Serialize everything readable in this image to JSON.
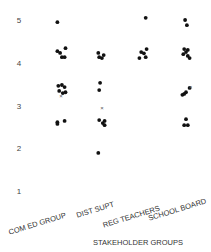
{
  "chart_data": {
    "type": "scatter",
    "title": "",
    "xlabel": "STAKEHOLDER GROUPS",
    "ylabel": "",
    "ylim": [
      1,
      5
    ],
    "yticks": [
      1,
      2,
      3,
      4,
      5
    ],
    "grid": false,
    "legend": "none",
    "categories": [
      "COM ED GROUP",
      "DIST SUPT",
      "REG TEACHERS",
      "SCHOOL BOARD"
    ],
    "series": [
      {
        "name": "COM ED GROUP",
        "points": [
          {
            "jitter": -0.2,
            "y": 4.95,
            "marker": "dot"
          },
          {
            "jitter": -0.2,
            "y": 4.27,
            "marker": "dot"
          },
          {
            "jitter": -0.05,
            "y": 4.23,
            "marker": "dot"
          },
          {
            "jitter": 0.25,
            "y": 4.34,
            "marker": "dot"
          },
          {
            "jitter": 0.05,
            "y": 4.13,
            "marker": "dot"
          },
          {
            "jitter": 0.2,
            "y": 4.13,
            "marker": "dot"
          },
          {
            "jitter": -0.15,
            "y": 3.46,
            "marker": "dot"
          },
          {
            "jitter": 0.05,
            "y": 3.48,
            "marker": "dot"
          },
          {
            "jitter": 0.2,
            "y": 3.43,
            "marker": "dot"
          },
          {
            "jitter": -0.1,
            "y": 3.34,
            "marker": "dot"
          },
          {
            "jitter": 0.1,
            "y": 3.29,
            "marker": "dot"
          },
          {
            "jitter": 0.25,
            "y": 3.31,
            "marker": "dot"
          },
          {
            "jitter": 0.0,
            "y": 3.22,
            "marker": "x"
          },
          {
            "jitter": -0.2,
            "y": 2.61,
            "marker": "dot"
          },
          {
            "jitter": -0.2,
            "y": 2.57,
            "marker": "dot"
          },
          {
            "jitter": 0.2,
            "y": 2.64,
            "marker": "dot"
          }
        ]
      },
      {
        "name": "DIST SUPT",
        "points": [
          {
            "jitter": -0.15,
            "y": 4.23,
            "marker": "dot"
          },
          {
            "jitter": -0.1,
            "y": 4.13,
            "marker": "dot"
          },
          {
            "jitter": 0.15,
            "y": 4.18,
            "marker": "dot"
          },
          {
            "jitter": 0.05,
            "y": 4.11,
            "marker": "dot"
          },
          {
            "jitter": -0.05,
            "y": 3.53,
            "marker": "dot"
          },
          {
            "jitter": -0.1,
            "y": 3.36,
            "marker": "dot"
          },
          {
            "jitter": 0.05,
            "y": 2.94,
            "marker": "x"
          },
          {
            "jitter": -0.1,
            "y": 2.66,
            "marker": "dot"
          },
          {
            "jitter": 0.1,
            "y": 2.59,
            "marker": "dot"
          },
          {
            "jitter": 0.2,
            "y": 2.64,
            "marker": "dot"
          },
          {
            "jitter": 0.2,
            "y": 2.54,
            "marker": "dot"
          },
          {
            "jitter": -0.15,
            "y": 1.89,
            "marker": "dot"
          }
        ]
      },
      {
        "name": "REG TEACHERS",
        "points": [
          {
            "jitter": 0.15,
            "y": 5.05,
            "marker": "dot"
          },
          {
            "jitter": -0.1,
            "y": 4.25,
            "marker": "dot"
          },
          {
            "jitter": 0.05,
            "y": 4.22,
            "marker": "dot"
          },
          {
            "jitter": -0.2,
            "y": 4.11,
            "marker": "dot"
          },
          {
            "jitter": 0.15,
            "y": 4.13,
            "marker": "dot"
          },
          {
            "jitter": 0.2,
            "y": 4.32,
            "marker": "dot"
          }
        ]
      },
      {
        "name": "SCHOOL BOARD",
        "points": [
          {
            "jitter": -0.05,
            "y": 5.0,
            "marker": "dot"
          },
          {
            "jitter": 0.05,
            "y": 4.88,
            "marker": "dot"
          },
          {
            "jitter": -0.1,
            "y": 4.32,
            "marker": "dot"
          },
          {
            "jitter": 0.1,
            "y": 4.3,
            "marker": "dot"
          },
          {
            "jitter": -0.15,
            "y": 4.2,
            "marker": "dot"
          },
          {
            "jitter": 0.0,
            "y": 4.25,
            "marker": "dot"
          },
          {
            "jitter": 0.1,
            "y": 4.16,
            "marker": "dot"
          },
          {
            "jitter": 0.2,
            "y": 4.11,
            "marker": "dot"
          },
          {
            "jitter": 0.2,
            "y": 3.41,
            "marker": "dot"
          },
          {
            "jitter": 0.0,
            "y": 3.31,
            "marker": "dot"
          },
          {
            "jitter": -0.1,
            "y": 3.27,
            "marker": "dot"
          },
          {
            "jitter": -0.2,
            "y": 3.25,
            "marker": "dot"
          },
          {
            "jitter": 0.25,
            "y": 3.44,
            "marker": "x"
          },
          {
            "jitter": 0.0,
            "y": 2.68,
            "marker": "dot"
          },
          {
            "jitter": -0.1,
            "y": 2.54,
            "marker": "dot"
          },
          {
            "jitter": 0.1,
            "y": 2.54,
            "marker": "dot"
          }
        ]
      }
    ],
    "colors": {
      "marker": "#111111",
      "text": "#333333"
    }
  }
}
